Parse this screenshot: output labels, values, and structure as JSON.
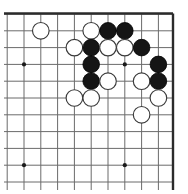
{
  "figure": {
    "kind": "go-board-diagram"
  },
  "board": {
    "geometry": {
      "origin_x": 24,
      "origin_y": 14,
      "spacing": 16.8,
      "columns": 9,
      "rows": 10,
      "stone_radius": 8.3,
      "board_right_edge_x": 173,
      "board_top_edge_y": 13.5,
      "board_bottom_visible_y": 190,
      "board_left_visible_x": 4
    },
    "colors": {
      "background": "#ffffff",
      "grid": "#6b6b6b",
      "grid_faint": "#8d8d8d",
      "border": "#2b2b2b",
      "black_stone": "#151515",
      "white_stone_fill": "#ffffff",
      "white_stone_edge": "#3a3a3a",
      "star_point": "#1a1a1a"
    },
    "edges": {
      "top_border": true,
      "right_border": true,
      "left_border": false,
      "bottom_border": false
    },
    "star_points": [
      {
        "name": "star-point-upper-left",
        "col": 0,
        "row": 3
      },
      {
        "name": "star-point-upper-right",
        "col": 6,
        "row": 3
      },
      {
        "name": "star-point-lower-left",
        "col": 0,
        "row": 9
      },
      {
        "name": "star-point-lower-right",
        "col": 6,
        "row": 9
      }
    ],
    "stones": [
      {
        "name": "white-stone-c1-r1",
        "color": "white",
        "col": 1,
        "row": 1
      },
      {
        "name": "white-stone-c4-r1",
        "color": "white",
        "col": 4,
        "row": 1
      },
      {
        "name": "black-stone-c5-r1",
        "color": "black",
        "col": 5,
        "row": 1
      },
      {
        "name": "black-stone-c6-r1",
        "color": "black",
        "col": 6,
        "row": 1
      },
      {
        "name": "white-stone-c3-r2",
        "color": "white",
        "col": 3,
        "row": 2
      },
      {
        "name": "black-stone-c4-r2",
        "color": "black",
        "col": 4,
        "row": 2
      },
      {
        "name": "white-stone-c5-r2",
        "color": "white",
        "col": 5,
        "row": 2
      },
      {
        "name": "white-stone-c6-r2",
        "color": "white",
        "col": 6,
        "row": 2
      },
      {
        "name": "black-stone-c7-r2",
        "color": "black",
        "col": 7,
        "row": 2
      },
      {
        "name": "black-stone-c4-r3",
        "color": "black",
        "col": 4,
        "row": 3
      },
      {
        "name": "black-stone-c8-r3",
        "color": "black",
        "col": 8,
        "row": 3
      },
      {
        "name": "black-stone-c4-r4",
        "color": "black",
        "col": 4,
        "row": 4
      },
      {
        "name": "white-stone-c5-r4",
        "color": "white",
        "col": 5,
        "row": 4
      },
      {
        "name": "white-stone-c7-r4",
        "color": "white",
        "col": 7,
        "row": 4
      },
      {
        "name": "black-stone-c8-r4",
        "color": "black",
        "col": 8,
        "row": 4
      },
      {
        "name": "white-stone-c3-r5",
        "color": "white",
        "col": 3,
        "row": 5
      },
      {
        "name": "white-stone-c4-r5",
        "color": "white",
        "col": 4,
        "row": 5
      },
      {
        "name": "white-stone-c8-r5",
        "color": "white",
        "col": 8,
        "row": 5
      },
      {
        "name": "white-stone-c7-r6",
        "color": "white",
        "col": 7,
        "row": 6
      }
    ],
    "counts": {
      "black_stones": 8,
      "white_stones": 11,
      "total_stones": 19
    }
  }
}
